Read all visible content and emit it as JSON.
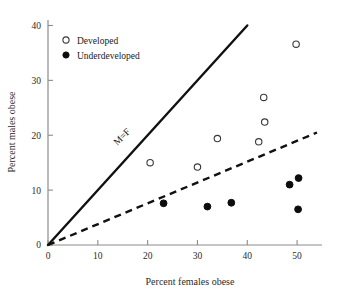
{
  "chart_data": {
    "type": "scatter",
    "title": "",
    "xlabel": "Percent females obese",
    "ylabel": "Percent males obese",
    "xlim": [
      0,
      55
    ],
    "ylim": [
      0,
      41
    ],
    "xticks": [
      0,
      10,
      20,
      30,
      40,
      50
    ],
    "yticks": [
      0,
      10,
      20,
      30,
      40
    ],
    "grid": false,
    "legend_position": "top-left",
    "series": [
      {
        "name": "Developed",
        "marker": "open-circle",
        "points": [
          {
            "x": 20.5,
            "y": 15.0
          },
          {
            "x": 30.0,
            "y": 14.2
          },
          {
            "x": 34.0,
            "y": 19.4
          },
          {
            "x": 42.3,
            "y": 18.8
          },
          {
            "x": 43.5,
            "y": 22.4
          },
          {
            "x": 43.3,
            "y": 26.9
          },
          {
            "x": 49.8,
            "y": 36.6
          }
        ]
      },
      {
        "name": "Underdeveloped",
        "marker": "filled-circle",
        "points": [
          {
            "x": 23.2,
            "y": 7.6
          },
          {
            "x": 32.0,
            "y": 7.0
          },
          {
            "x": 36.8,
            "y": 7.7
          },
          {
            "x": 48.5,
            "y": 11.0
          },
          {
            "x": 50.3,
            "y": 12.2
          },
          {
            "x": 50.2,
            "y": 6.5
          }
        ]
      }
    ],
    "reference_lines": [
      {
        "name": "M=F",
        "label": "M=F",
        "style": "solid",
        "from": {
          "x": 0,
          "y": 0
        },
        "to": {
          "x": 40,
          "y": 40
        }
      },
      {
        "name": "fit",
        "label": "",
        "style": "dashed",
        "from": {
          "x": 0,
          "y": 0
        },
        "to": {
          "x": 54,
          "y": 20.5
        }
      }
    ]
  },
  "legend": {
    "items": [
      {
        "label": "Developed",
        "marker": "open-circle"
      },
      {
        "label": "Underdeveloped",
        "marker": "filled-circle"
      }
    ]
  },
  "axes": {
    "x_title": "Percent females obese",
    "y_title": "Percent males obese",
    "x_tick_labels": [
      "0",
      "10",
      "20",
      "30",
      "40",
      "50"
    ],
    "y_tick_labels": [
      "0",
      "10",
      "20",
      "30",
      "40"
    ]
  },
  "annotations": {
    "mf_line_label": "M=F"
  },
  "colors": {
    "axis": "#8c8c8c",
    "text": "#2b2b2b",
    "line": "#111111",
    "marker_fill": "#0d0d0d",
    "marker_stroke": "#3a3a3a",
    "background": "#ffffff"
  }
}
